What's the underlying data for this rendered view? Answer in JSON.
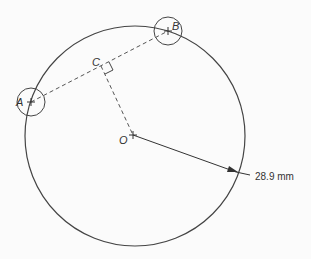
{
  "diagram": {
    "points": {
      "A": {
        "label": "A"
      },
      "B": {
        "label": "B"
      },
      "C": {
        "label": "C"
      },
      "O": {
        "label": "O"
      }
    },
    "radius_label": "28.9 mm",
    "colors": {
      "line": "#444444",
      "background": "#fbfbfb"
    }
  }
}
